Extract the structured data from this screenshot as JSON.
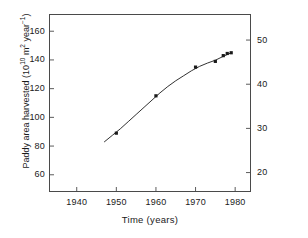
{
  "chart_data": {
    "type": "line",
    "title": "",
    "subtitle": "",
    "xlabel": "Time (years)",
    "ylabel": "Paddy area harvested (10^10 m^2 year^-1)",
    "ylabel_parts": {
      "prefix": "Paddy area harvested  (10",
      "exp1": "10",
      "mid": " m",
      "exp2": "2",
      "mid2": " year",
      "exp3": "−1",
      "suffix": ")"
    },
    "xlim": [
      1933,
      1984
    ],
    "ylim": [
      48,
      172
    ],
    "ylim_right": [
      15.6,
      55.9
    ],
    "xticks": [
      1940,
      1950,
      1960,
      1970,
      1980
    ],
    "yticks_left": [
      60,
      80,
      100,
      120,
      140,
      160
    ],
    "yticks_right": [
      20,
      30,
      40,
      50
    ],
    "grid": false,
    "legend": null,
    "legend_position": "none",
    "marker": "square",
    "marker_color": "#1a1a1a",
    "line_color": "#1a1a1a",
    "series": [
      {
        "name": "Paddy area harvested",
        "x": [
          1950,
          1960,
          1970,
          1975,
          1977,
          1978,
          1979
        ],
        "values": [
          89,
          115,
          135,
          139,
          143,
          144.5,
          145
        ]
      }
    ],
    "fit_curve": {
      "x": [
        1947,
        1949,
        1951,
        1953,
        1955,
        1957,
        1959,
        1961,
        1963,
        1965,
        1967,
        1969,
        1971,
        1973,
        1975,
        1977,
        1979
      ],
      "y": [
        83,
        87.5,
        92,
        97,
        102,
        107,
        112,
        117,
        121.5,
        125.5,
        129,
        132.5,
        135.5,
        137.8,
        139.8,
        142.5,
        145
      ]
    }
  },
  "axes": {
    "x_title": "Time (years)",
    "y_left_title": "Paddy area harvested (10",
    "y_left_unit_mid": " m",
    "y_left_unit_year": " year",
    "y_left_close": ")"
  }
}
